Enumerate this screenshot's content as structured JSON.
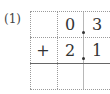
{
  "problem": {
    "label": "(1)",
    "rows": [
      {
        "op": "",
        "digits": [
          "0",
          "3"
        ]
      },
      {
        "op": "+",
        "digits": [
          "2",
          "1"
        ]
      },
      {
        "op": "",
        "digits": [
          "",
          ""
        ]
      }
    ],
    "decimal_point": "."
  }
}
